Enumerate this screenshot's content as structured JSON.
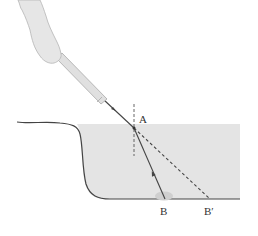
{
  "diagram": {
    "labels": {
      "point_a": "A",
      "point_b": "B",
      "point_b_prime": "B′"
    },
    "colors": {
      "water": "#e4e4e4",
      "ground_line": "#444444",
      "ray": "#444444",
      "hand": "#e6e6e6",
      "flashlight": "#e0e0e0",
      "pebble": "#cfcfcf"
    },
    "elements": [
      "hand",
      "flashlight",
      "incident-ray",
      "normal-line",
      "refracted-ray",
      "apparent-ray",
      "water",
      "ground",
      "pebble"
    ]
  }
}
